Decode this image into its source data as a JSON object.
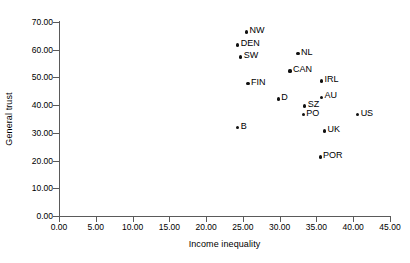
{
  "chart_data": {
    "type": "scatter",
    "title": "",
    "xlabel": "Income inequality",
    "ylabel": "General trust",
    "xlim": [
      0,
      45
    ],
    "ylim": [
      0,
      70
    ],
    "xticks": [
      "0.00",
      "5.00",
      "10.00",
      "15.00",
      "20.00",
      "25.00",
      "30.00",
      "35.00",
      "40.00",
      "45.00"
    ],
    "xtick_values": [
      0,
      5,
      10,
      15,
      20,
      25,
      30,
      35,
      40,
      45
    ],
    "yticks": [
      "0.00",
      "10.00",
      "20.00",
      "30.00",
      "40.00",
      "50.00",
      "60.00",
      "70.00"
    ],
    "ytick_values": [
      0,
      10,
      20,
      30,
      40,
      50,
      60,
      70
    ],
    "grid": false,
    "legend": false,
    "marker": "filled-circle",
    "marker_color": "#111111",
    "axis_color": "#5a5a5a",
    "points": [
      {
        "label": "NW",
        "x": 25.5,
        "y": 66.4
      },
      {
        "label": "DEN",
        "x": 24.3,
        "y": 61.7
      },
      {
        "label": "SW",
        "x": 24.7,
        "y": 57.4
      },
      {
        "label": "NL",
        "x": 32.5,
        "y": 58.5
      },
      {
        "label": "CAN",
        "x": 31.4,
        "y": 52.3
      },
      {
        "label": "FIN",
        "x": 25.7,
        "y": 47.7
      },
      {
        "label": "IRL",
        "x": 35.7,
        "y": 48.7
      },
      {
        "label": "D",
        "x": 29.8,
        "y": 42.2
      },
      {
        "label": "AU",
        "x": 35.7,
        "y": 42.9
      },
      {
        "label": "SZ",
        "x": 33.4,
        "y": 39.7
      },
      {
        "label": "PO",
        "x": 33.2,
        "y": 36.5
      },
      {
        "label": "US",
        "x": 40.6,
        "y": 36.5
      },
      {
        "label": "UK",
        "x": 36.1,
        "y": 30.7
      },
      {
        "label": "B",
        "x": 24.3,
        "y": 31.8
      },
      {
        "label": "POR",
        "x": 35.5,
        "y": 21.3
      }
    ]
  }
}
